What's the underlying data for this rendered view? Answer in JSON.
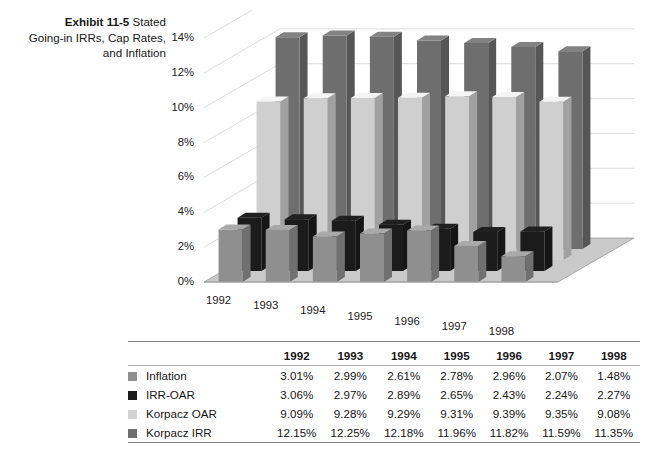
{
  "title": {
    "exhibit": "Exhibit 11-5",
    "line1_rest": "Stated",
    "line2": "Going-in IRRs, Cap Rates,",
    "line3": "and Inflation"
  },
  "chart_data": {
    "type": "bar",
    "title": "Exhibit 11-5 Stated Going-in IRRs, Cap Rates, and Inflation",
    "xlabel": "",
    "ylabel": "",
    "ylim": [
      0,
      14
    ],
    "ytick_labels": [
      "0%",
      "2%",
      "4%",
      "6%",
      "8%",
      "10%",
      "12%",
      "14%"
    ],
    "ytick_values": [
      0,
      2,
      4,
      6,
      8,
      10,
      12,
      14
    ],
    "grid": true,
    "legend_position": "table-left",
    "projection": "3d-columns",
    "categories": [
      "1992",
      "1993",
      "1994",
      "1995",
      "1996",
      "1997",
      "1998"
    ],
    "series": [
      {
        "name": "Inflation",
        "color": "#8f8f8f",
        "values": [
          3.01,
          2.99,
          2.61,
          2.78,
          2.96,
          2.07,
          1.48
        ],
        "labels": [
          "3.01%",
          "2.99%",
          "2.61%",
          "2.78%",
          "2.96%",
          "2.07%",
          "1.48%"
        ]
      },
      {
        "name": "IRR-OAR",
        "color": "#1b1b1b",
        "values": [
          3.06,
          2.97,
          2.89,
          2.65,
          2.43,
          2.24,
          2.27
        ],
        "labels": [
          "3.06%",
          "2.97%",
          "2.89%",
          "2.65%",
          "2.43%",
          "2.24%",
          "2.27%"
        ]
      },
      {
        "name": "Korpacz OAR",
        "color": "#cfcfcf",
        "values": [
          9.09,
          9.28,
          9.29,
          9.31,
          9.39,
          9.35,
          9.08
        ],
        "labels": [
          "9.09%",
          "9.28%",
          "9.29%",
          "9.31%",
          "9.39%",
          "9.35%",
          "9.08%"
        ]
      },
      {
        "name": "Korpacz IRR",
        "color": "#6e6e6e",
        "values": [
          12.15,
          12.25,
          12.18,
          11.96,
          11.82,
          11.59,
          11.35
        ],
        "labels": [
          "12.15%",
          "12.25%",
          "12.18%",
          "11.96%",
          "11.82%",
          "11.59%",
          "11.35%"
        ]
      }
    ]
  },
  "table": {
    "corner_label": "",
    "columns": [
      "1992",
      "1993",
      "1994",
      "1995",
      "1996",
      "1997",
      "1998"
    ],
    "rows": [
      {
        "swatch": "#8f8f8f",
        "label": "Inflation",
        "values": [
          "3.01%",
          "2.99%",
          "2.61%",
          "2.78%",
          "2.96%",
          "2.07%",
          "1.48%"
        ]
      },
      {
        "swatch": "#1b1b1b",
        "label": "IRR-OAR",
        "values": [
          "3.06%",
          "2.97%",
          "2.89%",
          "2.65%",
          "2.43%",
          "2.24%",
          "2.27%"
        ]
      },
      {
        "swatch": "#d3d3d3",
        "label": "Korpacz OAR",
        "values": [
          "9.09%",
          "9.28%",
          "9.29%",
          "9.31%",
          "9.39%",
          "9.35%",
          "9.08%"
        ]
      },
      {
        "swatch": "#6e6e6e",
        "label": "Korpacz IRR",
        "values": [
          "12.15%",
          "12.25%",
          "12.18%",
          "11.96%",
          "11.82%",
          "11.59%",
          "11.35%"
        ]
      }
    ]
  },
  "palette": {
    "floor": "#c9c9c9",
    "floor_edge": "#9d9d9d",
    "gridline": "#d8d8d8",
    "axis": "#bdbdbd"
  }
}
